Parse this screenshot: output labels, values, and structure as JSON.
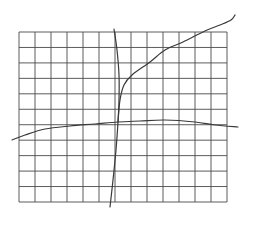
{
  "figure": {
    "width": 255,
    "height": 240,
    "background_color": "#ffffff"
  },
  "grid": {
    "left": 19,
    "top": 32,
    "right": 227,
    "bottom": 202,
    "columns": 13,
    "rows": 11,
    "line_color": "#4a4a4a"
  },
  "curves": [
    {
      "name": "near-vertical-curve",
      "color": "#3a3a3a",
      "points": [
        [
          114,
          29
        ],
        [
          117,
          50
        ],
        [
          119,
          75
        ],
        [
          119,
          100
        ],
        [
          118,
          122
        ],
        [
          116,
          150
        ],
        [
          113,
          180
        ],
        [
          110,
          207
        ]
      ]
    },
    {
      "name": "rising-concave-curve",
      "color": "#3a3a3a",
      "points": [
        [
          118,
          122
        ],
        [
          120,
          100
        ],
        [
          124,
          85
        ],
        [
          132,
          75
        ],
        [
          150,
          62
        ],
        [
          165,
          50
        ],
        [
          183,
          42
        ],
        [
          205,
          31
        ],
        [
          220,
          25
        ],
        [
          231,
          20
        ],
        [
          235,
          15
        ]
      ]
    },
    {
      "name": "flat-horizontal-curve",
      "color": "#3a3a3a",
      "points": [
        [
          12,
          140
        ],
        [
          25,
          135
        ],
        [
          45,
          129
        ],
        [
          70,
          126
        ],
        [
          95,
          124
        ],
        [
          118,
          122
        ],
        [
          140,
          121
        ],
        [
          165,
          120
        ],
        [
          195,
          122
        ],
        [
          215,
          125
        ],
        [
          238,
          127
        ]
      ]
    }
  ]
}
